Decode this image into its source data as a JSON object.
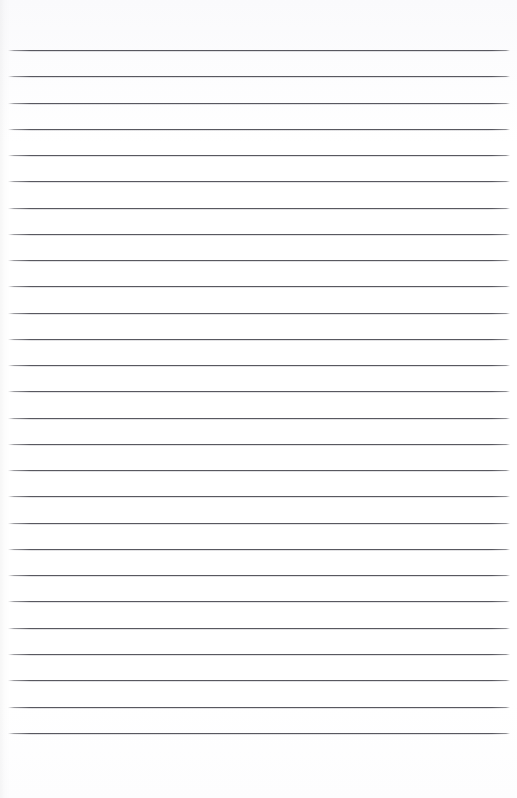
{
  "document": {
    "kind": "scanned-lined-paper",
    "title": "Blank ruled notebook page",
    "page_width_px": 517,
    "page_height_px": 798,
    "background_color": "#ffffff",
    "has_text_content": false,
    "has_handwriting": false,
    "has_margin_rule": false,
    "has_holes": false
  },
  "ruling": {
    "line_color": "#4a4a52",
    "line_thickness_px": 1,
    "line_count": 27,
    "first_line_y_px": 50,
    "line_spacing_px": 26.3,
    "last_line_y_px": 733,
    "line_start_x_px": 8,
    "line_end_x_px": 510,
    "top_margin_px": 50,
    "bottom_margin_px": 65,
    "left_margin_px": 8,
    "right_margin_px": 7,
    "lines_y_px": [
      50,
      76,
      103,
      129,
      155,
      181,
      208,
      234,
      260,
      286,
      313,
      339,
      365,
      391,
      418,
      444,
      470,
      496,
      523,
      549,
      575,
      601,
      628,
      654,
      680,
      707,
      733
    ]
  },
  "artifacts": {
    "left_edge_shadow": true,
    "left_edge_shadow_width_px": 10,
    "line_end_fade": true
  }
}
